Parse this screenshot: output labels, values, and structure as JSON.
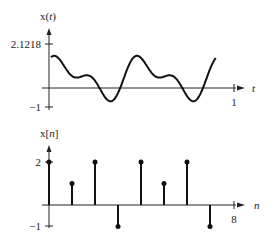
{
  "chart_data": [
    {
      "type": "line",
      "title": "",
      "ylabel": "x(t)",
      "xlabel": "t",
      "y_ticks": [
        "2.1218",
        "-1"
      ],
      "x_ticks": [
        "1"
      ],
      "ylim": [
        -1,
        2.1218
      ],
      "xlim": [
        0,
        1
      ],
      "description": "Continuous-time periodic signal x(t) = cos(2*pi*4t)... sum of sinusoids, max 2.1218, min -1 over t in [0,1]",
      "grid": false
    },
    {
      "type": "stem",
      "title": "",
      "ylabel": "x[n]",
      "xlabel": "n",
      "y_ticks": [
        "2",
        "-1"
      ],
      "x_ticks": [
        "8"
      ],
      "x": [
        0,
        1,
        2,
        3,
        4,
        5,
        6,
        7
      ],
      "values": [
        2,
        1,
        2,
        -1,
        2,
        1,
        2,
        -1
      ],
      "ylim": [
        -1,
        2
      ],
      "grid": false
    }
  ],
  "labels": {
    "top_ylabel": "x(",
    "top_yvar": "t",
    "top_yclose": ")",
    "top_xlabel": "t",
    "top_ymax": "2.1218",
    "top_ymin": "−1",
    "top_xtick": "1",
    "bot_ylabel": "x[",
    "bot_yvar": "n",
    "bot_yclose": "]",
    "bot_xlabel": "n",
    "bot_ymax": "2",
    "bot_ymin": "−1",
    "bot_xtick": "8"
  }
}
